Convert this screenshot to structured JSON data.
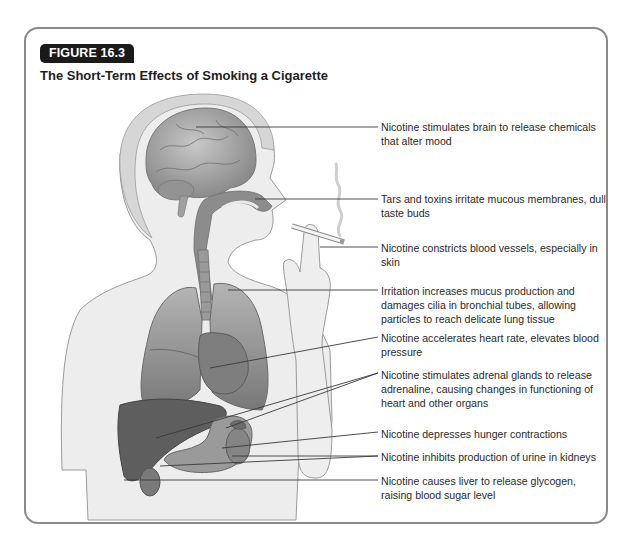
{
  "figure": {
    "badge": "FIGURE 16.3",
    "title": "The Short-Term Effects of Smoking a Cigarette"
  },
  "colors": {
    "frame": "#8a8a8a",
    "badge_bg": "#1a1a1a",
    "badge_text": "#ffffff",
    "organ_dark": "#6e6e6e",
    "skin": "#ececec"
  },
  "labels": [
    {
      "id": "brain",
      "text": "Nicotine stimulates brain to release chemicals that alter mood"
    },
    {
      "id": "mouth",
      "text": "Tars and toxins irritate mucous membranes, dull taste buds"
    },
    {
      "id": "skin",
      "text": "Nicotine constricts blood vessels, especially in skin"
    },
    {
      "id": "lungs",
      "text": "Irritation increases mucus production and damages cilia in bronchial tubes, allowing particles to reach delicate lung tissue"
    },
    {
      "id": "heart",
      "text": "Nicotine accelerates heart rate, elevates blood pressure"
    },
    {
      "id": "adrenal",
      "text": "Nicotine stimulates adrenal glands to release adrenaline, causing changes in functioning of heart and other organs"
    },
    {
      "id": "stomach",
      "text": "Nicotine depresses hunger contractions"
    },
    {
      "id": "kidneys",
      "text": "Nicotine inhibits production of urine in kidneys"
    },
    {
      "id": "liver",
      "text": "Nicotine causes liver to release glycogen, raising blood sugar level"
    }
  ]
}
